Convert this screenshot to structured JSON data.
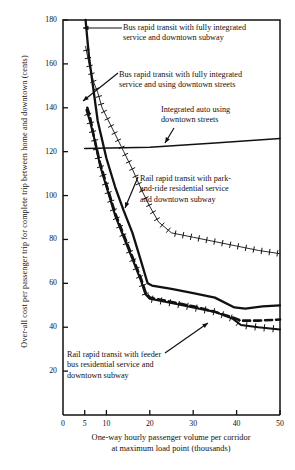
{
  "chart_data": {
    "type": "line",
    "title": "",
    "xlabel": "One-way hourly passenger volume per corridor at maximum load point (thousands)",
    "ylabel": "Over-all cost per passenger trip for complete trip between home and downtown (cents)",
    "xlim": [
      0,
      50
    ],
    "ylim": [
      0,
      180
    ],
    "xticks": [
      0,
      5,
      10,
      20,
      30,
      40,
      50
    ],
    "yticks": [
      20,
      40,
      60,
      80,
      100,
      120,
      140,
      160,
      180
    ],
    "grid": false,
    "legend_position": "inline-annotations",
    "series": [
      {
        "name": "Bus rapid transit with fully integrated service and downtown subway",
        "style": "solid-thick",
        "x": [
          5.2,
          6.0,
          8.0,
          10.0,
          12.0,
          14.0,
          16.0,
          18.0,
          19.5,
          20.5,
          25.0,
          30.0,
          35.0,
          39.5,
          42.0,
          46.0,
          50.0
        ],
        "y": [
          180,
          163,
          134,
          117,
          104,
          93,
          83,
          70,
          60,
          59,
          57.5,
          55.5,
          53.5,
          49,
          48.5,
          49.5,
          50
        ]
      },
      {
        "name": "Bus rapid transit with fully integrated service and using downtown streets",
        "style": "dashed-thick",
        "x": [
          5.6,
          6.2,
          7.0,
          8.5,
          10.0,
          12.0,
          14.0,
          16.0,
          18.0,
          19.0,
          20.0,
          25.0,
          30.0,
          35.0,
          39.0,
          41.0,
          45.0,
          50.0
        ],
        "y": [
          140,
          136,
          128,
          115,
          105,
          92,
          82,
          72,
          62,
          56,
          53.5,
          51.5,
          49.5,
          47,
          44.5,
          43,
          43,
          43.5
        ]
      },
      {
        "name": "Integrated auto using downtown streets",
        "style": "solid-thin",
        "x": [
          5.0,
          20.0,
          35.0,
          50.0
        ],
        "y": [
          121.5,
          122.0,
          124.0,
          126.0
        ]
      },
      {
        "name": "Rail rapid transit with park-and-ride residential service and downtown subway",
        "style": "hatched-thin",
        "x": [
          5.2,
          6.0,
          7.0,
          8.0,
          9.0,
          10.0,
          12.0,
          14.0,
          16.0,
          18.0,
          20.0,
          22.0,
          25.0,
          30.0,
          35.0,
          40.0,
          45.0,
          50.0
        ],
        "y": [
          168,
          160,
          152,
          147,
          140,
          136,
          128,
          120,
          112,
          103,
          95,
          88,
          83,
          81,
          79,
          77,
          75,
          73.5
        ]
      },
      {
        "name": "Rail rapid transit with feeder bus residential service and downtown subway",
        "style": "hatched-thick",
        "x": [
          5.4,
          6.2,
          7.2,
          8.5,
          10.0,
          12.0,
          14.0,
          16.0,
          18.0,
          19.0,
          20.0,
          25.0,
          30.0,
          35.0,
          39.0,
          41.0,
          45.0,
          50.0
        ],
        "y": [
          139,
          134,
          126,
          114,
          104,
          91,
          81,
          71,
          61,
          55,
          53,
          51,
          49,
          47,
          44,
          41,
          40,
          39
        ]
      }
    ],
    "annotations": [
      {
        "id": "bus-subway",
        "lines": [
          "Bus rapid transit with fully integrated",
          "service and downtown subway"
        ],
        "text_x": 123,
        "text_y": 23,
        "arrow": {
          "from_x": 122,
          "from_y": 28,
          "to_x": 83,
          "to_y": 28
        }
      },
      {
        "id": "bus-streets",
        "lines": [
          "Bus rapid transit with fully integrated",
          "service and using downtown streets"
        ],
        "text_x": 119,
        "text_y": 70,
        "arrow": {
          "from_x": 118,
          "from_y": 73,
          "to_x": 83,
          "to_y": 101
        }
      },
      {
        "id": "integrated-auto",
        "lines": [
          "Integrated auto using",
          "downtown streets"
        ],
        "text_x": 161,
        "text_y": 105,
        "arrow": {
          "from_x": 174,
          "from_y": 128,
          "to_x": 165,
          "to_y": 143
        }
      },
      {
        "id": "rail-park-and-ride",
        "lines": [
          "Rail rapid transit with park-",
          "and-ride residential service",
          "and downtown subway"
        ],
        "text_x": 140,
        "text_y": 174,
        "arrow": {
          "from_x": 138,
          "from_y": 177,
          "to_x": 125,
          "to_y": 208
        }
      },
      {
        "id": "rail-feeder-bus",
        "lines": [
          "Rail rapid transit with feeder",
          "bus residential service and",
          "downtown subway"
        ],
        "text_x": 67,
        "text_y": 350,
        "arrow": {
          "from_x": 165,
          "from_y": 353,
          "to_x": 208,
          "to_y": 323
        }
      }
    ]
  },
  "axes": {
    "y_ticks": [
      "180",
      "160",
      "140",
      "120",
      "100",
      "80",
      "60",
      "40",
      "20"
    ],
    "x_ticks": [
      "0",
      "5",
      "10",
      "20",
      "30",
      "40",
      "50"
    ],
    "y_title": "Over-all cost per passenger trip for complete trip between home and downtown (cents)",
    "x_title_line1": "One-way hourly passenger volume per corridor",
    "x_title_line2": "at maximum load point (thousands)"
  },
  "colors": {
    "ink": "#111111",
    "background": "#ffffff"
  }
}
